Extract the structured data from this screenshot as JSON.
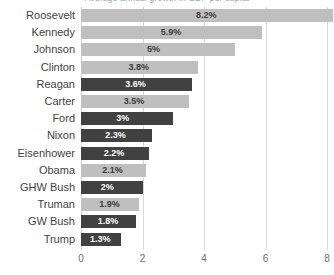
{
  "chart_data": {
    "type": "bar",
    "orientation": "horizontal",
    "title": "Average annual growth in GDP per capita",
    "title_clipped": true,
    "xlabel": "",
    "ylabel": "",
    "xlim": [
      0,
      8
    ],
    "xticks": [
      "0",
      "2",
      "4",
      "6",
      "8"
    ],
    "xtick_values": [
      0,
      2,
      4,
      6,
      8
    ],
    "grid": true,
    "grid_axis": "x",
    "legend": "none",
    "categories": [
      "Roosevelt",
      "Kennedy",
      "Johnson",
      "Clinton",
      "Reagan",
      "Carter",
      "Ford",
      "Nixon",
      "Eisenhower",
      "Obama",
      "GHW Bush",
      "Truman",
      "GW Bush",
      "Trump"
    ],
    "values": [
      8.2,
      5.9,
      5.0,
      3.8,
      3.6,
      3.5,
      3.0,
      2.3,
      2.2,
      2.1,
      2.0,
      1.9,
      1.8,
      1.3
    ],
    "data_labels": [
      "8.2%",
      "5.9%",
      "5%",
      "3.8%",
      "3.6%",
      "3.5%",
      "3%",
      "2.3%",
      "2.2%",
      "2.1%",
      "2%",
      "1.9%",
      "1.8%",
      "1.3%"
    ],
    "bar_styles": [
      "light",
      "light",
      "light",
      "light",
      "dark",
      "light",
      "dark",
      "dark",
      "dark",
      "light",
      "dark",
      "light",
      "dark",
      "dark"
    ],
    "colors": {
      "light_bar": "#bfbfbf",
      "dark_bar": "#414141",
      "gridline": "#d9d9d9",
      "category_label": "#3f3f3f",
      "tick_label": "#6e6e6e",
      "value_label_on_light": "#3c3c3c",
      "value_label_on_dark": "#ffffff",
      "background": "#ffffff"
    }
  }
}
